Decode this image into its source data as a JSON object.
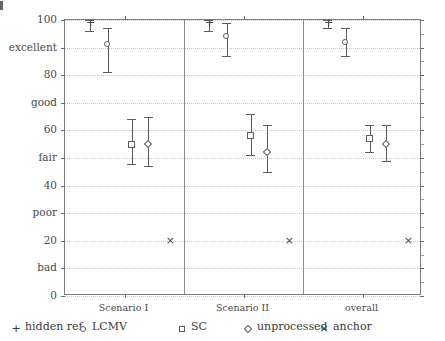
{
  "chart_data": {
    "type": "scatter",
    "title": "",
    "subtitle": "",
    "xlabel": "",
    "ylabel": "",
    "ylim": [
      0,
      100
    ],
    "grid": true,
    "legend_position": "bottom",
    "y_ticks": [
      {
        "value": 100,
        "label": "100",
        "kind": "numeric"
      },
      {
        "value": 90,
        "label": "excellent",
        "kind": "category"
      },
      {
        "value": 80,
        "label": "80",
        "kind": "numeric"
      },
      {
        "value": 70,
        "label": "good",
        "kind": "category"
      },
      {
        "value": 60,
        "label": "60",
        "kind": "numeric"
      },
      {
        "value": 50,
        "label": "fair",
        "kind": "category"
      },
      {
        "value": 40,
        "label": "40",
        "kind": "numeric"
      },
      {
        "value": 30,
        "label": "poor",
        "kind": "category"
      },
      {
        "value": 20,
        "label": "20",
        "kind": "numeric"
      },
      {
        "value": 10,
        "label": "bad",
        "kind": "category"
      },
      {
        "value": 0,
        "label": "0",
        "kind": "numeric"
      }
    ],
    "panels": [
      {
        "id": "scenario-1",
        "label": "Scenario I"
      },
      {
        "id": "scenario-2",
        "label": "Scenario II"
      },
      {
        "id": "overall",
        "label": "overall"
      }
    ],
    "series": [
      {
        "name": "hidden ref.",
        "marker": "plus",
        "values": [
          99,
          99,
          99
        ],
        "ci_low": [
          96,
          96,
          97
        ],
        "ci_high": [
          100,
          100,
          100
        ]
      },
      {
        "name": "LCMV",
        "marker": "circle",
        "values": [
          91,
          94,
          92
        ],
        "ci_low": [
          81,
          87,
          87
        ],
        "ci_high": [
          97,
          99,
          97
        ]
      },
      {
        "name": "SC",
        "marker": "square",
        "values": [
          55,
          58,
          57
        ],
        "ci_low": [
          48,
          51,
          52
        ],
        "ci_high": [
          64,
          66,
          62
        ]
      },
      {
        "name": "unprocessed",
        "marker": "diamond",
        "values": [
          55,
          52,
          55
        ],
        "ci_low": [
          47,
          45,
          49
        ],
        "ci_high": [
          65,
          62,
          62
        ]
      },
      {
        "name": "anchor",
        "marker": "cross",
        "values": [
          20,
          20,
          20
        ],
        "ci_low": [
          20,
          20,
          20
        ],
        "ci_high": [
          20,
          20,
          20
        ]
      }
    ]
  },
  "legend": {
    "items": [
      {
        "symbol": "plus-symbol",
        "label": "hidden ref."
      },
      {
        "symbol": "circle-symbol",
        "label": "LCMV"
      },
      {
        "symbol": "square-symbol",
        "label": "SC"
      },
      {
        "symbol": "diamond-symbol",
        "label": "unprocessed"
      },
      {
        "symbol": "cross-symbol",
        "label": "anchor"
      }
    ]
  },
  "glyphs": {
    "plus": "+",
    "cross": "×"
  },
  "colors": {
    "frame": "#7d7d7d",
    "grid": "#c9c9c9",
    "marker": "#5d5d5d",
    "text": "#3a3a3a",
    "background": "#ffffff"
  }
}
